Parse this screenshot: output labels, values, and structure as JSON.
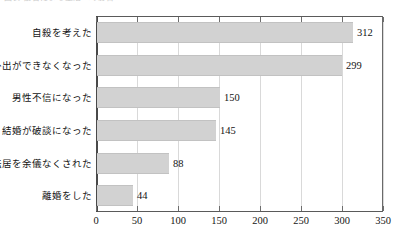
{
  "header": {
    "caption": "図表  被害による生活への影響"
  },
  "chart_data": {
    "type": "bar",
    "orientation": "horizontal",
    "title": "",
    "subtitle": "",
    "xlabel": "",
    "ylabel": "",
    "categories": [
      "自殺を考えた",
      "外出ができなくなった",
      "男性不信になった",
      "結婚が破談になった",
      "転居を余儀なくされた",
      "離婚をした"
    ],
    "values": [
      312,
      299,
      150,
      145,
      88,
      44
    ],
    "value_labels": [
      "312",
      "299",
      "150",
      "145",
      "88",
      "44"
    ],
    "xlim": [
      0,
      350
    ],
    "xticks": [
      0,
      50,
      100,
      150,
      200,
      250,
      300,
      350
    ],
    "xtick_labels": [
      "0",
      "50",
      "100",
      "150",
      "200",
      "250",
      "300",
      "350"
    ],
    "grid": true,
    "grid_axis": "x",
    "legend": false,
    "legend_position": "none",
    "bar_color": "#d2d2d2",
    "bar_edge_color": "#c2c2c2",
    "axis_color": "#4a4a4a",
    "grid_color": "#d9d9d9",
    "text_color": "#141414"
  }
}
